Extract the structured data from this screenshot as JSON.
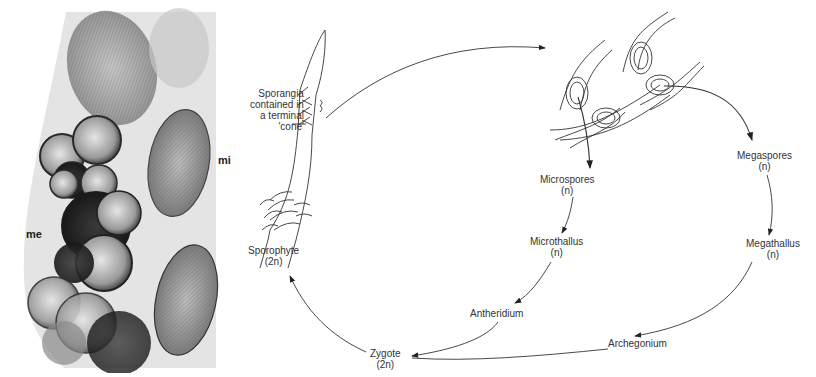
{
  "photo": {
    "labels": {
      "megaspores": "me",
      "microspores": "mi"
    }
  },
  "diagram": {
    "sporangia_note": [
      "Sporangia",
      "contained in",
      "a terminal",
      "'cone'"
    ],
    "sporophyte": {
      "name": "Sporophyte",
      "ploidy": "(2n)"
    },
    "microspores": {
      "name": "Microspores",
      "ploidy": "(n)"
    },
    "megaspores": {
      "name": "Megaspores",
      "ploidy": "(n)"
    },
    "microthallus": {
      "name": "Microthallus",
      "ploidy": "(n)"
    },
    "megathallus": {
      "name": "Megathallus",
      "ploidy": "(n)"
    },
    "antheridium": {
      "name": "Antheridium"
    },
    "archegonium": {
      "name": "Archegonium"
    },
    "zygote": {
      "name": "Zygote",
      "ploidy": "(2n)"
    }
  }
}
